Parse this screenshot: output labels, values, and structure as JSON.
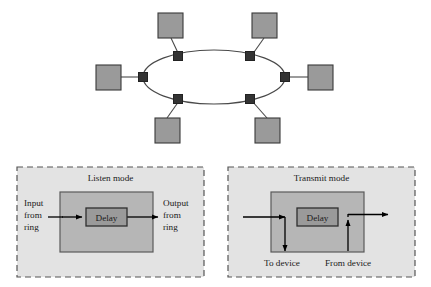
{
  "figure": {
    "name": "ring-topology-and-repeater-modes",
    "background": "#ffffff"
  },
  "colors": {
    "page_background": "#ffffff",
    "station_fill": "#9a9a9a",
    "station_stroke": "#3a3a3a",
    "ring_node_fill": "#333333",
    "ring_node_stroke": "#222222",
    "ring_line": "#4a4a4a",
    "panel_fill": "#e3e3e3",
    "panel_dash_stroke": "#555555",
    "repeater_fill": "#b6b6b6",
    "repeater_stroke": "#5a5a5a",
    "delay_fill": "#9a9a9a",
    "delay_stroke": "#2e2e2e",
    "arrow_color": "#000000",
    "text_color": "#1a1a1a"
  },
  "ring_diagram": {
    "name": "ring-network-topology",
    "ellipse": {
      "cx": 214,
      "cy": 77,
      "rx": 71,
      "ry": 27
    },
    "ring_nodes": [
      {
        "id": "node-top-left",
        "label": "repeater",
        "x": 178,
        "y": 56
      },
      {
        "id": "node-top-right",
        "label": "repeater",
        "x": 250,
        "y": 56
      },
      {
        "id": "node-left",
        "label": "repeater",
        "x": 143,
        "y": 77
      },
      {
        "id": "node-right",
        "label": "repeater",
        "x": 285,
        "y": 77
      },
      {
        "id": "node-bottom-left",
        "label": "repeater",
        "x": 178,
        "y": 99
      },
      {
        "id": "node-bottom-right",
        "label": "repeater",
        "x": 250,
        "y": 99
      }
    ],
    "stations": [
      {
        "id": "station-top-left",
        "label": "station",
        "x": 158,
        "y": 13,
        "w": 25,
        "h": 25
      },
      {
        "id": "station-top-right",
        "label": "station",
        "x": 252,
        "y": 13,
        "w": 25,
        "h": 25
      },
      {
        "id": "station-left",
        "label": "station",
        "x": 96,
        "y": 65,
        "w": 25,
        "h": 25
      },
      {
        "id": "station-right",
        "label": "station",
        "x": 308,
        "y": 65,
        "w": 25,
        "h": 25
      },
      {
        "id": "station-bottom-left",
        "label": "station",
        "x": 155,
        "y": 118,
        "w": 25,
        "h": 25
      },
      {
        "id": "station-bottom-right",
        "label": "station",
        "x": 255,
        "y": 118,
        "w": 25,
        "h": 25
      }
    ]
  },
  "panels": [
    {
      "id": "listen-mode-panel",
      "title": "Listen mode",
      "box": {
        "x": 17,
        "y": 167,
        "w": 187,
        "h": 110
      },
      "repeater_box": {
        "x": 60,
        "y": 192,
        "w": 93,
        "h": 60
      },
      "delay": {
        "label": "Delay",
        "x": 86,
        "y": 208,
        "w": 41,
        "h": 18
      },
      "labels": [
        {
          "id": "input-from-ring-label",
          "lines": [
            "Input",
            "from",
            "ring"
          ],
          "x": 24,
          "y": 199,
          "align": "start"
        },
        {
          "id": "output-from-ring-label",
          "lines": [
            "Output",
            "from",
            "ring"
          ],
          "x": 163,
          "y": 199,
          "align": "start"
        }
      ]
    },
    {
      "id": "transmit-mode-panel",
      "title": "Transmit mode",
      "box": {
        "x": 228,
        "y": 167,
        "w": 187,
        "h": 110
      },
      "repeater_box": {
        "x": 271,
        "y": 192,
        "w": 93,
        "h": 60
      },
      "delay": {
        "label": "Delay",
        "x": 297,
        "y": 208,
        "w": 41,
        "h": 18
      },
      "labels": [
        {
          "id": "to-device-label",
          "lines": [
            "To device"
          ],
          "x": 264,
          "y": 263,
          "align": "start"
        },
        {
          "id": "from-device-label",
          "lines": [
            "From device"
          ],
          "x": 325,
          "y": 263,
          "align": "start"
        }
      ]
    }
  ]
}
